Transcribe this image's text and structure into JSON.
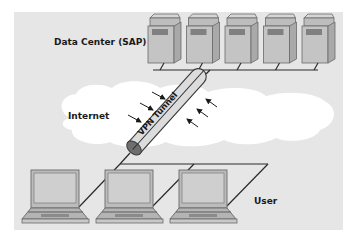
{
  "diagram": {
    "labels": {
      "data_center": "Data Center (SAP)",
      "internet": "Internet",
      "tunnel": "VPN Tunnel",
      "user": "User"
    },
    "servers": {
      "count": 5
    },
    "users": {
      "count": 3
    },
    "attack_arrows": {
      "left_count": 3,
      "right_count": 3
    },
    "colors": {
      "panel": "#e6e6e6",
      "cloud": "#ffffff",
      "device_body": "#c4c4c4",
      "device_edge": "#6a6a6a",
      "tunnel_fill": "#dcdcdc",
      "tunnel_mouth": "#6e6e6e",
      "line": "#2a2a2a"
    }
  }
}
